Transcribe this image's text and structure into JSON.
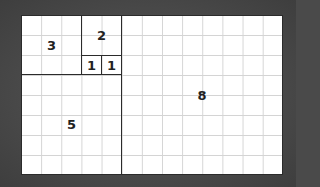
{
  "diagram": {
    "grid": {
      "cols": 13,
      "rows": 8
    },
    "squares": [
      {
        "label": "3",
        "col": 0,
        "row": 0,
        "size": 3
      },
      {
        "label": "2",
        "col": 3,
        "row": 0,
        "size": 2
      },
      {
        "label": "1",
        "col": 3,
        "row": 2,
        "size": 1
      },
      {
        "label": "1",
        "col": 4,
        "row": 2,
        "size": 1
      },
      {
        "label": "5",
        "col": 0,
        "row": 3,
        "size": 5
      },
      {
        "label": "8",
        "col": 5,
        "row": 0,
        "size": 8
      }
    ]
  }
}
